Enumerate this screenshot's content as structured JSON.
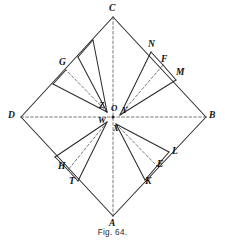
{
  "figure": {
    "caption": "Fig. 64.",
    "caption_x": 0,
    "caption_y": 228,
    "stroke_color": "#2b2b2b",
    "dash_color": "#555555",
    "background": "#ffffff",
    "width": 225,
    "height": 243
  },
  "diagram_data": {
    "type": "geometric-construction",
    "description": "Square ABCD drawn as a diamond with diagonals AC and BD meeting at centre O; four interior fans of rays radiate from the near-centre points Z, Y, W and X to marked divisions on the four sides.",
    "vertices": [
      {
        "id": "C",
        "label": "C",
        "x": 113,
        "y": 17,
        "label_x": 109,
        "label_y": 4
      },
      {
        "id": "B",
        "label": "B",
        "x": 206,
        "y": 117,
        "label_x": 209,
        "label_y": 111
      },
      {
        "id": "A",
        "label": "A",
        "x": 113,
        "y": 216,
        "label_x": 109,
        "label_y": 219
      },
      {
        "id": "D",
        "label": "D",
        "x": 21,
        "y": 117,
        "label_x": 8,
        "label_y": 111
      }
    ],
    "centre_points": [
      {
        "id": "O",
        "label": "O",
        "x": 113,
        "y": 117,
        "label_x": 111,
        "label_y": 104
      },
      {
        "id": "Z",
        "label": "Z",
        "x": 107,
        "y": 112,
        "label_x": 99,
        "label_y": 101
      },
      {
        "id": "Y",
        "label": "Y",
        "x": 120,
        "y": 115,
        "label_x": 122,
        "label_y": 106
      },
      {
        "id": "W",
        "label": "W",
        "x": 107,
        "y": 122,
        "label_x": 98,
        "label_y": 116
      },
      {
        "id": "X",
        "label": "X",
        "x": 116,
        "y": 124,
        "label_x": 113,
        "label_y": 124
      }
    ],
    "side_points": [
      {
        "id": "G",
        "label": "G",
        "x": 66,
        "y": 70,
        "label_x": 59,
        "label_y": 58,
        "side": "DC"
      },
      {
        "id": "N",
        "label": "N",
        "x": 151,
        "y": 52,
        "label_x": 148,
        "label_y": 40,
        "side": "CB"
      },
      {
        "id": "F",
        "label": "F",
        "x": 163,
        "y": 65,
        "label_x": 161,
        "label_y": 55,
        "side": "CB"
      },
      {
        "id": "M",
        "label": "M",
        "x": 176,
        "y": 80,
        "label_x": 176,
        "label_y": 68,
        "side": "CB"
      },
      {
        "id": "L",
        "label": "L",
        "x": 169,
        "y": 152,
        "label_x": 172,
        "label_y": 147
      },
      {
        "id": "E",
        "label": "E",
        "x": 157,
        "y": 166,
        "label_x": 157,
        "label_y": 160
      },
      {
        "id": "K",
        "label": "K",
        "x": 145,
        "y": 180,
        "label_x": 145,
        "label_y": 177
      },
      {
        "id": "H",
        "label": "H",
        "x": 68,
        "y": 170,
        "label_x": 58,
        "label_y": 162
      },
      {
        "id": "T",
        "label": "T",
        "x": 78,
        "y": 181,
        "label_x": 69,
        "label_y": 177
      }
    ],
    "square_edges": [
      {
        "from": "C",
        "to": "B",
        "style": "solid"
      },
      {
        "from": "B",
        "to": "A",
        "style": "solid"
      },
      {
        "from": "A",
        "to": "D",
        "style": "solid"
      },
      {
        "from": "D",
        "to": "C",
        "style": "solid"
      }
    ],
    "diagonals": [
      {
        "from": "C",
        "to": "A",
        "style": "dashed"
      },
      {
        "from": "D",
        "to": "B",
        "style": "dashed"
      }
    ],
    "rays": [
      {
        "from": "Z",
        "to_x": 93,
        "to_y": 40,
        "style": "solid"
      },
      {
        "from": "Z",
        "to_x": 78,
        "to_y": 57,
        "style": "solid"
      },
      {
        "from": "Z",
        "to_x": 66,
        "to_y": 70,
        "style": "dashed"
      },
      {
        "from": "Z",
        "to_x": 53,
        "to_y": 84,
        "style": "solid"
      },
      {
        "from": "Y",
        "to_x": 151,
        "to_y": 52,
        "style": "solid"
      },
      {
        "from": "Y",
        "to_x": 163,
        "to_y": 65,
        "style": "dashed"
      },
      {
        "from": "Y",
        "to_x": 176,
        "to_y": 80,
        "style": "solid"
      },
      {
        "from": "X",
        "to_x": 169,
        "to_y": 152,
        "style": "solid"
      },
      {
        "from": "X",
        "to_x": 157,
        "to_y": 166,
        "style": "dashed"
      },
      {
        "from": "X",
        "to_x": 145,
        "to_y": 180,
        "style": "solid"
      },
      {
        "from": "W",
        "to_x": 55,
        "to_y": 157,
        "style": "solid"
      },
      {
        "from": "W",
        "to_x": 68,
        "to_y": 170,
        "style": "dashed"
      },
      {
        "from": "W",
        "to_x": 78,
        "to_y": 181,
        "style": "solid"
      }
    ],
    "chords": [
      {
        "from_x": 93,
        "to_x": 78,
        "from_y": 40,
        "to_y": 57,
        "style": "solid"
      },
      {
        "from_x": 66,
        "to_x": 53,
        "from_y": 70,
        "to_y": 84,
        "style": "solid"
      },
      {
        "from_x": 151,
        "to_x": 163,
        "from_y": 52,
        "to_y": 65,
        "style": "solid"
      },
      {
        "from_x": 176,
        "to_x": 163,
        "from_y": 80,
        "to_y": 65,
        "style": "solid"
      },
      {
        "from_x": 169,
        "to_x": 157,
        "from_y": 152,
        "to_y": 166,
        "style": "solid"
      },
      {
        "from_x": 145,
        "to_x": 157,
        "from_y": 180,
        "to_y": 166,
        "style": "solid"
      },
      {
        "from_x": 55,
        "to_x": 68,
        "from_y": 157,
        "to_y": 170,
        "style": "solid"
      },
      {
        "from_x": 78,
        "to_x": 68,
        "from_y": 181,
        "to_y": 170,
        "style": "solid"
      }
    ]
  }
}
